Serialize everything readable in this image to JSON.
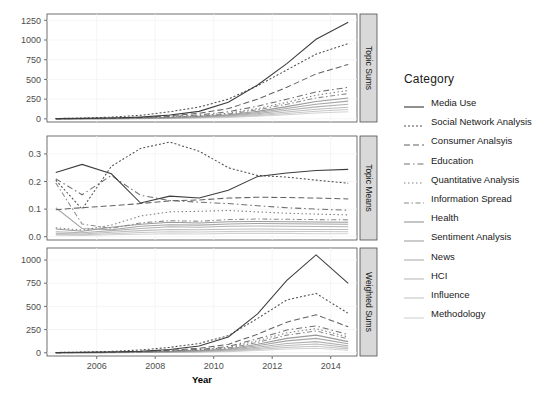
{
  "chart_data": {
    "type": "line",
    "title": "",
    "xlabel": "Year",
    "ylabel": "",
    "legend_title": "Category",
    "legend_position": "right",
    "grid": true,
    "x": [
      2004.6,
      2005.5,
      2006.5,
      2007.5,
      2008.5,
      2009.5,
      2010.5,
      2011.5,
      2012.5,
      2013.5,
      2014.6
    ],
    "xlim": [
      2004.3,
      2014.9
    ],
    "xticks": [
      2006,
      2008,
      2010,
      2012,
      2014
    ],
    "xticklabels": [
      "2006",
      "2008",
      "2010",
      "2012",
      "2014"
    ],
    "panels": [
      {
        "strip_label": "Topic Sums",
        "ylim": [
          -40,
          1330
        ],
        "yticks": [
          0,
          250,
          500,
          750,
          1000,
          1250
        ],
        "yticklabels": [
          "0",
          "250",
          "500",
          "750",
          "1000",
          "1250"
        ],
        "series": [
          {
            "name": "Media Use",
            "values": [
              3,
              6,
              12,
              22,
              48,
              95,
              210,
              430,
              700,
              1010,
              1225
            ]
          },
          {
            "name": "Social Network Analysis",
            "values": [
              4,
              10,
              22,
              45,
              90,
              150,
              250,
              420,
              620,
              820,
              955
            ]
          },
          {
            "name": "Consumer Analsyis",
            "values": [
              2,
              5,
              10,
              20,
              40,
              70,
              130,
              250,
              400,
              570,
              690
            ]
          },
          {
            "name": "Education",
            "values": [
              2,
              4,
              8,
              15,
              28,
              50,
              90,
              160,
              250,
              340,
              400
            ]
          },
          {
            "name": "Quantitative Analysis",
            "values": [
              1,
              3,
              6,
              12,
              22,
              40,
              72,
              130,
              210,
              300,
              360
            ]
          },
          {
            "name": "Information Spread",
            "values": [
              1,
              3,
              5,
              10,
              19,
              34,
              62,
              115,
              185,
              265,
              320
            ]
          },
          {
            "name": "Health",
            "values": [
              1,
              2,
              4,
              8,
              15,
              28,
              52,
              95,
              155,
              220,
              265
            ]
          },
          {
            "name": "Sentiment Analysis",
            "values": [
              1,
              2,
              4,
              7,
              13,
              24,
              44,
              80,
              130,
              185,
              225
            ]
          },
          {
            "name": "News",
            "values": [
              1,
              2,
              3,
              6,
              11,
              20,
              36,
              66,
              108,
              152,
              185
            ]
          },
          {
            "name": "HCI",
            "values": [
              1,
              1,
              3,
              5,
              9,
              16,
              29,
              53,
              86,
              122,
              148
            ]
          },
          {
            "name": "Influence",
            "values": [
              0,
              1,
              2,
              4,
              7,
              13,
              23,
              42,
              68,
              96,
              118
            ]
          },
          {
            "name": "Methodology",
            "values": [
              0,
              1,
              2,
              3,
              6,
              10,
              18,
              33,
              53,
              74,
              90
            ]
          }
        ]
      },
      {
        "strip_label": "Topic Means",
        "ylim": [
          -0.012,
          0.365
        ],
        "yticks": [
          0.0,
          0.1,
          0.2,
          0.3
        ],
        "yticklabels": [
          "0.0",
          "0.1",
          "0.2",
          "0.3"
        ],
        "series": [
          {
            "name": "Media Use",
            "values": [
              0.233,
              0.262,
              0.228,
              0.122,
              0.147,
              0.14,
              0.168,
              0.218,
              0.231,
              0.24,
              0.244
            ]
          },
          {
            "name": "Social Network Analysis",
            "values": [
              0.205,
              0.1,
              0.255,
              0.32,
              0.343,
              0.31,
              0.25,
              0.222,
              0.216,
              0.205,
              0.194
            ]
          },
          {
            "name": "Consumer Analsyis",
            "values": [
              0.098,
              0.105,
              0.112,
              0.12,
              0.13,
              0.133,
              0.14,
              0.143,
              0.142,
              0.14,
              0.137
            ]
          },
          {
            "name": "Education",
            "values": [
              0.21,
              0.152,
              0.222,
              0.15,
              0.131,
              0.125,
              0.12,
              0.112,
              0.105,
              0.1,
              0.096
            ]
          },
          {
            "name": "Quantitative Analysis",
            "values": [
              0.032,
              0.024,
              0.042,
              0.075,
              0.09,
              0.092,
              0.095,
              0.09,
              0.085,
              0.082,
              0.079
            ]
          },
          {
            "name": "Information Spread",
            "values": [
              0.195,
              0.046,
              0.03,
              0.05,
              0.058,
              0.056,
              0.062,
              0.064,
              0.063,
              0.062,
              0.061
            ]
          },
          {
            "name": "Health",
            "values": [
              0.028,
              0.02,
              0.034,
              0.045,
              0.052,
              0.05,
              0.054,
              0.055,
              0.054,
              0.053,
              0.052
            ]
          },
          {
            "name": "Sentiment Analysis",
            "values": [
              0.105,
              0.03,
              0.025,
              0.038,
              0.043,
              0.042,
              0.046,
              0.048,
              0.047,
              0.046,
              0.045
            ]
          },
          {
            "name": "News",
            "values": [
              0.018,
              0.014,
              0.022,
              0.03,
              0.036,
              0.034,
              0.038,
              0.039,
              0.038,
              0.037,
              0.036
            ]
          },
          {
            "name": "HCI",
            "values": [
              0.012,
              0.01,
              0.016,
              0.022,
              0.026,
              0.025,
              0.027,
              0.028,
              0.027,
              0.026,
              0.026
            ]
          },
          {
            "name": "Influence",
            "values": [
              0.008,
              0.007,
              0.011,
              0.015,
              0.018,
              0.017,
              0.019,
              0.02,
              0.019,
              0.019,
              0.018
            ]
          },
          {
            "name": "Methodology",
            "values": [
              0.005,
              0.004,
              0.007,
              0.009,
              0.011,
              0.01,
              0.012,
              0.012,
              0.012,
              0.011,
              0.011
            ]
          }
        ]
      },
      {
        "strip_label": "Weighted Sums",
        "ylim": [
          -35,
          1130
        ],
        "yticks": [
          0,
          250,
          500,
          750,
          1000
        ],
        "yticklabels": [
          "0",
          "250",
          "500",
          "750",
          "1000"
        ],
        "series": [
          {
            "name": "Media Use",
            "values": [
              2,
              4,
              9,
              17,
              35,
              72,
              170,
              420,
              780,
              1055,
              748
            ]
          },
          {
            "name": "Social Network Analysis",
            "values": [
              3,
              7,
              15,
              30,
              58,
              100,
              185,
              370,
              570,
              640,
              425
            ]
          },
          {
            "name": "Consumer Analsyis",
            "values": [
              1,
              3,
              7,
              14,
              27,
              48,
              90,
              200,
              330,
              410,
              280
            ]
          },
          {
            "name": "Education",
            "values": [
              1,
              3,
              5,
              10,
              20,
              36,
              68,
              150,
              245,
              290,
              195
            ]
          },
          {
            "name": "Quantitative Analysis",
            "values": [
              1,
              2,
              4,
              9,
              17,
              30,
              58,
              130,
              215,
              260,
              170
            ]
          },
          {
            "name": "Information Spread",
            "values": [
              1,
              2,
              4,
              8,
              15,
              27,
              50,
              112,
              190,
              235,
              150
            ]
          },
          {
            "name": "Health",
            "values": [
              1,
              2,
              3,
              6,
              12,
              22,
              41,
              92,
              155,
              190,
              120
            ]
          },
          {
            "name": "Sentiment Analysis",
            "values": [
              0,
              1,
              3,
              5,
              10,
              18,
              34,
              76,
              128,
              155,
              98
            ]
          },
          {
            "name": "News",
            "values": [
              0,
              1,
              2,
              4,
              8,
              14,
              27,
              60,
              100,
              120,
              75
            ]
          },
          {
            "name": "HCI",
            "values": [
              0,
              1,
              2,
              3,
              6,
              11,
              21,
              46,
              78,
              95,
              58
            ]
          },
          {
            "name": "Influence",
            "values": [
              0,
              1,
              1,
              2,
              5,
              8,
              16,
              35,
              58,
              70,
              42
            ]
          },
          {
            "name": "Methodology",
            "values": [
              0,
              0,
              1,
              2,
              3,
              6,
              11,
              24,
              40,
              48,
              28
            ]
          }
        ]
      }
    ],
    "series_style": [
      {
        "name": "Media Use",
        "color": "#3d3d3d",
        "dash": "none",
        "key": "solid"
      },
      {
        "name": "Social Network Analysis",
        "color": "#4f4f4f",
        "dash": "2,2",
        "key": "dotted-short"
      },
      {
        "name": "Consumer Analsyis",
        "color": "#616161",
        "dash": "6,3",
        "key": "dashed"
      },
      {
        "name": "Education",
        "color": "#707070",
        "dash": "6,3,1.5,3",
        "key": "dash-dot"
      },
      {
        "name": "Quantitative Analysis",
        "color": "#7f7f7f",
        "dash": "1.5,2.5",
        "key": "dotted"
      },
      {
        "name": "Information Spread",
        "color": "#8c8c8c",
        "dash": "5,2.5,1.5,2.5",
        "key": "dash-dot-long"
      },
      {
        "name": "Health",
        "color": "#9a9a9a",
        "dash": "none",
        "key": "solid"
      },
      {
        "name": "Sentiment Analysis",
        "color": "#a6a6a6",
        "dash": "none",
        "key": "solid"
      },
      {
        "name": "News",
        "color": "#b2b2b2",
        "dash": "none",
        "key": "solid"
      },
      {
        "name": "HCI",
        "color": "#bdbdbd",
        "dash": "none",
        "key": "solid"
      },
      {
        "name": "Influence",
        "color": "#c8c8c8",
        "dash": "none",
        "key": "solid"
      },
      {
        "name": "Methodology",
        "color": "#d3d3d3",
        "dash": "none",
        "key": "solid"
      }
    ]
  }
}
